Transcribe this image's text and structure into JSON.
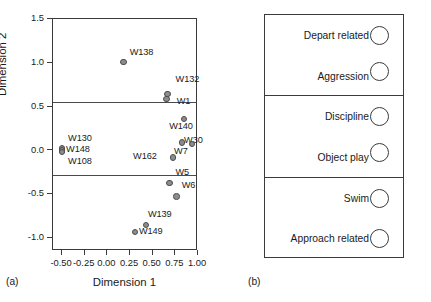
{
  "figure": {
    "panel_a_caption": "(a)",
    "panel_b_caption": "(b)"
  },
  "chart_data": [
    {
      "type": "scatter",
      "panel": "(a)",
      "title": "",
      "xlabel": "Dimension 1",
      "ylabel": "Dimension 2",
      "xlim": [
        -0.6,
        1.0
      ],
      "ylim": [
        -1.15,
        1.5
      ],
      "xticks": [
        -0.5,
        -0.25,
        0.0,
        0.25,
        0.5,
        0.75,
        1.0
      ],
      "xticklabels": [
        "-0.50",
        "-0.25",
        "0.00",
        "0.25",
        "0.50",
        "0.75",
        "1.00"
      ],
      "yticks": [
        1.5,
        1.0,
        0.5,
        0.0,
        -0.5,
        -1.0
      ],
      "yticklabels": [
        "1.5",
        "1.0",
        "0.5",
        "0.0",
        "-0.5",
        "-1.0"
      ],
      "grid": false,
      "legend": "none",
      "marker_color": "#8c8c8c",
      "marker_edge_color": "#4c4c4c",
      "hlines": [
        0.555,
        -0.28
      ],
      "points": [
        {
          "label": "W138",
          "x": 0.18,
          "y": 1.01,
          "label_dx": 6,
          "label_dy": -9,
          "label_align": "left"
        },
        {
          "label": "W132",
          "x": 0.665,
          "y": 0.645,
          "label_dx": 8,
          "label_dy": -14,
          "label_align": "left"
        },
        {
          "label": "W1",
          "x": 0.655,
          "y": 0.585,
          "label_dx": 10,
          "label_dy": 3,
          "label_align": "left"
        },
        {
          "label": "W140",
          "x": 0.845,
          "y": 0.355,
          "label_dx": -3,
          "label_dy": 8,
          "label_align": "center"
        },
        {
          "label": "W30",
          "x": 0.825,
          "y": 0.09,
          "label_dx": 2,
          "label_dy": -1,
          "label_align": "left"
        },
        {
          "label": "W7",
          "x": 0.935,
          "y": 0.075,
          "label_dx": -18,
          "label_dy": 8,
          "label_align": "left"
        },
        {
          "label": "W162",
          "x": 0.725,
          "y": -0.08,
          "label_dx": -40,
          "label_dy": 0,
          "label_align": "left"
        },
        {
          "label": "W130",
          "x": -0.5,
          "y": 0.02,
          "label_dx": 6,
          "label_dy": -10,
          "label_align": "left"
        },
        {
          "label": "W148",
          "x": -0.5,
          "y": 0.0,
          "label_dx": 4,
          "label_dy": 0,
          "label_align": "left"
        },
        {
          "label": "W108",
          "x": -0.5,
          "y": -0.02,
          "label_dx": 6,
          "label_dy": 10,
          "label_align": "left"
        },
        {
          "label": "W5",
          "x": 0.685,
          "y": -0.375,
          "label_dx": 6,
          "label_dy": -10,
          "label_align": "left"
        },
        {
          "label": "W6",
          "x": 0.765,
          "y": -0.525,
          "label_dx": 5,
          "label_dy": -10,
          "label_align": "left"
        },
        {
          "label": "W139",
          "x": 0.425,
          "y": -0.855,
          "label_dx": 2,
          "label_dy": -10,
          "label_align": "left"
        },
        {
          "label": "W149",
          "x": 0.305,
          "y": -0.935,
          "label_dx": 4,
          "label_dy": 0,
          "label_align": "left"
        }
      ]
    },
    {
      "type": "diagram",
      "panel": "(b)",
      "title": "",
      "description": "Three bracketed groups of labelled circles",
      "groups": [
        {
          "items": [
            {
              "label": "Depart related"
            },
            {
              "label": "Aggression",
              "offset": true
            }
          ]
        },
        {
          "items": [
            {
              "label": "Discipline"
            },
            {
              "label": "Object play",
              "offset": true
            }
          ]
        },
        {
          "items": [
            {
              "label": "Swim"
            },
            {
              "label": "Approach related"
            }
          ]
        }
      ]
    }
  ]
}
